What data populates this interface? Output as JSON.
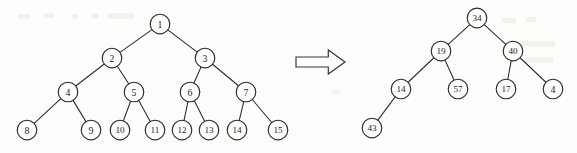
{
  "figure": {
    "background_color": "#fdfdfb",
    "stroke_color": "#2b2927",
    "node_fill": "#ffffff",
    "node_radius": 9.6
  },
  "arrow": {
    "name": "transformation-arrow",
    "direction": "right",
    "style": "hollow-block-arrow",
    "color": "#3a3734",
    "x": 296,
    "y": 50,
    "width": 49,
    "height": 24
  },
  "left_tree": {
    "name": "complete-binary-tree-indices",
    "node_count": 15,
    "root": "1",
    "nodes": [
      {
        "id": "n1",
        "label": "1",
        "cx": 160,
        "cy": 24,
        "r": 9.8
      },
      {
        "id": "n2",
        "label": "2",
        "cx": 112,
        "cy": 58,
        "r": 9.8
      },
      {
        "id": "n3",
        "label": "3",
        "cx": 205,
        "cy": 58,
        "r": 9.8
      },
      {
        "id": "n4",
        "label": "4",
        "cx": 68,
        "cy": 92,
        "r": 9.8
      },
      {
        "id": "n5",
        "label": "5",
        "cx": 134,
        "cy": 92,
        "r": 9.8
      },
      {
        "id": "n6",
        "label": "6",
        "cx": 190,
        "cy": 92,
        "r": 9.8
      },
      {
        "id": "n7",
        "label": "7",
        "cx": 246,
        "cy": 92,
        "r": 9.8
      },
      {
        "id": "n8",
        "label": "8",
        "cx": 27,
        "cy": 130,
        "r": 9.8
      },
      {
        "id": "n9",
        "label": "9",
        "cx": 91,
        "cy": 130,
        "r": 9.8
      },
      {
        "id": "n10",
        "label": "10",
        "cx": 120,
        "cy": 130,
        "r": 9.8
      },
      {
        "id": "n11",
        "label": "11",
        "cx": 155,
        "cy": 130,
        "r": 9.8
      },
      {
        "id": "n12",
        "label": "12",
        "cx": 182,
        "cy": 130,
        "r": 9.8
      },
      {
        "id": "n13",
        "label": "13",
        "cx": 209,
        "cy": 130,
        "r": 9.8
      },
      {
        "id": "n14",
        "label": "14",
        "cx": 237,
        "cy": 130,
        "r": 9.8
      },
      {
        "id": "n15",
        "label": "15",
        "cx": 278,
        "cy": 130,
        "r": 9.8
      }
    ],
    "edges": [
      [
        "n1",
        "n2"
      ],
      [
        "n1",
        "n3"
      ],
      [
        "n2",
        "n4"
      ],
      [
        "n2",
        "n5"
      ],
      [
        "n3",
        "n6"
      ],
      [
        "n3",
        "n7"
      ],
      [
        "n4",
        "n8"
      ],
      [
        "n4",
        "n9"
      ],
      [
        "n5",
        "n10"
      ],
      [
        "n5",
        "n11"
      ],
      [
        "n6",
        "n12"
      ],
      [
        "n6",
        "n13"
      ],
      [
        "n7",
        "n14"
      ],
      [
        "n7",
        "n15"
      ]
    ]
  },
  "right_tree": {
    "name": "binary-tree-values",
    "node_count": 8,
    "root": "34",
    "nodes": [
      {
        "id": "m34",
        "label": "34",
        "cx": 477,
        "cy": 18,
        "r": 9.8
      },
      {
        "id": "m19",
        "label": "19",
        "cx": 441,
        "cy": 51,
        "r": 9.8
      },
      {
        "id": "m40",
        "label": "40",
        "cx": 513,
        "cy": 51,
        "r": 9.8
      },
      {
        "id": "m14",
        "label": "14",
        "cx": 401,
        "cy": 89,
        "r": 9.8
      },
      {
        "id": "m57",
        "label": "57",
        "cx": 458,
        "cy": 89,
        "r": 9.8
      },
      {
        "id": "m17",
        "label": "17",
        "cx": 506,
        "cy": 89,
        "r": 9.8
      },
      {
        "id": "m4",
        "label": "4",
        "cx": 553,
        "cy": 89,
        "r": 9.8
      },
      {
        "id": "m43",
        "label": "43",
        "cx": 372,
        "cy": 128,
        "r": 9.8
      }
    ],
    "edges": [
      [
        "m34",
        "m19"
      ],
      [
        "m34",
        "m40"
      ],
      [
        "m19",
        "m14"
      ],
      [
        "m19",
        "m57"
      ],
      [
        "m40",
        "m17"
      ],
      [
        "m40",
        "m4"
      ],
      [
        "m14",
        "m43"
      ]
    ]
  },
  "artifacts": [
    {
      "x": 18,
      "y": 14,
      "w": 12,
      "h": 5
    },
    {
      "x": 44,
      "y": 13,
      "w": 10,
      "h": 5
    },
    {
      "x": 72,
      "y": 14,
      "w": 6,
      "h": 5
    },
    {
      "x": 92,
      "y": 13,
      "w": 7,
      "h": 6
    },
    {
      "x": 108,
      "y": 13,
      "w": 26,
      "h": 6
    },
    {
      "x": 332,
      "y": 90,
      "w": 8,
      "h": 4
    },
    {
      "x": 502,
      "y": 18,
      "w": 14,
      "h": 5
    },
    {
      "x": 526,
      "y": 17,
      "w": 10,
      "h": 5
    },
    {
      "x": 519,
      "y": 41,
      "w": 36,
      "h": 6
    },
    {
      "x": 525,
      "y": 57,
      "w": 28,
      "h": 6
    }
  ]
}
